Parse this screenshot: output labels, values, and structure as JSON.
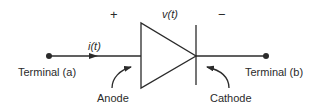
{
  "diagram": {
    "polarity": {
      "plus": "+",
      "minus": "−"
    },
    "voltage_label": "v(t)",
    "current_label": "i(t)",
    "terminal_a": "Terminal (a)",
    "terminal_b": "Terminal (b)",
    "anode_label": "Anode",
    "cathode_label": "Cathode",
    "colors": {
      "stroke": "#2b2b2b",
      "background": "#ffffff"
    }
  }
}
